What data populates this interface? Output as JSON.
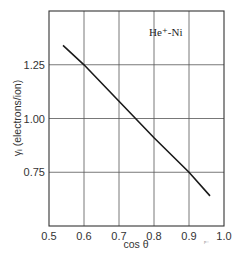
{
  "chart_data": {
    "type": "line",
    "title": "",
    "annotation": "He⁺-Ni",
    "xlabel": "cos θ",
    "ylabel": "γᵢ (electrons/ion)",
    "xlim": [
      0.5,
      1.0
    ],
    "ylim": [
      0.5,
      1.5
    ],
    "x_ticks": [
      0.5,
      0.6,
      0.7,
      0.8,
      0.9,
      1.0
    ],
    "x_tick_labels": [
      "0.5",
      "0.6",
      "0.7",
      "0.8",
      "0.9",
      "1.0"
    ],
    "y_ticks": [
      0.75,
      1.0,
      1.25
    ],
    "y_tick_labels": [
      "0.75",
      "1.00",
      "1.25"
    ],
    "grid": true,
    "legend": "none",
    "series": [
      {
        "name": "He⁺-Ni",
        "x": [
          0.54,
          0.6,
          0.7,
          0.8,
          0.9,
          0.96
        ],
        "y": [
          1.34,
          1.25,
          1.08,
          0.91,
          0.75,
          0.64
        ]
      }
    ]
  },
  "stray_mark": "ᵖ⁻"
}
